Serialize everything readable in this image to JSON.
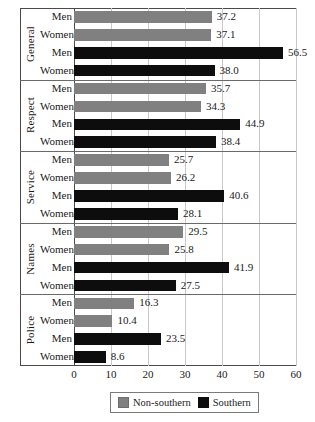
{
  "chart_data": {
    "type": "bar",
    "orientation": "horizontal",
    "title": "",
    "xlabel": "",
    "ylabel": "",
    "xlim": [
      0,
      60
    ],
    "xticks": [
      0,
      10,
      20,
      30,
      40,
      50,
      60
    ],
    "grid": true,
    "legend_position": "bottom",
    "groups": [
      "General",
      "Respect",
      "Service",
      "Names",
      "Police"
    ],
    "subcategories": [
      "Men",
      "Women"
    ],
    "series": [
      {
        "name": "Non-southern",
        "color": "#808080",
        "values": [
          37.2,
          37.1,
          35.7,
          34.3,
          25.7,
          26.2,
          29.5,
          25.8,
          16.3,
          10.4
        ]
      },
      {
        "name": "Southern",
        "color": "#0d0d0d",
        "values": [
          56.5,
          38.0,
          44.9,
          38.4,
          40.6,
          28.1,
          41.9,
          27.5,
          23.5,
          8.6
        ]
      }
    ],
    "rows": [
      {
        "group": "General",
        "sex": "Men",
        "series": "Non-southern",
        "value": 37.2,
        "label": "37.2"
      },
      {
        "group": "General",
        "sex": "Women",
        "series": "Non-southern",
        "value": 37.1,
        "label": "37.1"
      },
      {
        "group": "General",
        "sex": "Men",
        "series": "Southern",
        "value": 56.5,
        "label": "56.5"
      },
      {
        "group": "General",
        "sex": "Women",
        "series": "Southern",
        "value": 38.0,
        "label": "38.0"
      },
      {
        "group": "Respect",
        "sex": "Men",
        "series": "Non-southern",
        "value": 35.7,
        "label": "35.7"
      },
      {
        "group": "Respect",
        "sex": "Women",
        "series": "Non-southern",
        "value": 34.3,
        "label": "34.3"
      },
      {
        "group": "Respect",
        "sex": "Men",
        "series": "Southern",
        "value": 44.9,
        "label": "44.9"
      },
      {
        "group": "Respect",
        "sex": "Women",
        "series": "Southern",
        "value": 38.4,
        "label": "38.4"
      },
      {
        "group": "Service",
        "sex": "Men",
        "series": "Non-southern",
        "value": 25.7,
        "label": "25.7"
      },
      {
        "group": "Service",
        "sex": "Women",
        "series": "Non-southern",
        "value": 26.2,
        "label": "26.2"
      },
      {
        "group": "Service",
        "sex": "Men",
        "series": "Southern",
        "value": 40.6,
        "label": "40.6"
      },
      {
        "group": "Service",
        "sex": "Women",
        "series": "Southern",
        "value": 28.1,
        "label": "28.1"
      },
      {
        "group": "Names",
        "sex": "Men",
        "series": "Non-southern",
        "value": 29.5,
        "label": "29.5"
      },
      {
        "group": "Names",
        "sex": "Women",
        "series": "Non-southern",
        "value": 25.8,
        "label": "25.8"
      },
      {
        "group": "Names",
        "sex": "Men",
        "series": "Southern",
        "value": 41.9,
        "label": "41.9"
      },
      {
        "group": "Names",
        "sex": "Women",
        "series": "Southern",
        "value": 27.5,
        "label": "27.5"
      },
      {
        "group": "Police",
        "sex": "Men",
        "series": "Non-southern",
        "value": 16.3,
        "label": "16.3"
      },
      {
        "group": "Police",
        "sex": "Women",
        "series": "Non-southern",
        "value": 10.4,
        "label": "10.4"
      },
      {
        "group": "Police",
        "sex": "Men",
        "series": "Southern",
        "value": 23.5,
        "label": "23.5"
      },
      {
        "group": "Police",
        "sex": "Women",
        "series": "Southern",
        "value": 8.6,
        "label": "8.6"
      }
    ]
  },
  "legend": {
    "items": [
      {
        "label": "Non-southern",
        "color": "#808080",
        "swatch": "legend-swatch-non-southern"
      },
      {
        "label": "Southern",
        "color": "#0d0d0d",
        "swatch": "legend-swatch-southern"
      }
    ]
  },
  "axis": {
    "tick_labels": [
      "0",
      "10",
      "20",
      "30",
      "40",
      "50",
      "60"
    ]
  }
}
